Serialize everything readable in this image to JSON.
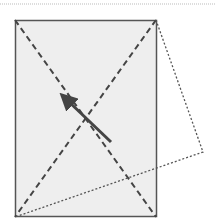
{
  "diagram": {
    "colors": {
      "background": "#ffffff",
      "rect_fill": "#eeeeee",
      "rect_stroke": "#555555",
      "dash_stroke": "#444444",
      "dotted_stroke": "#555555",
      "arrow": "#444444",
      "top_line": "#bbbbbb"
    }
  }
}
